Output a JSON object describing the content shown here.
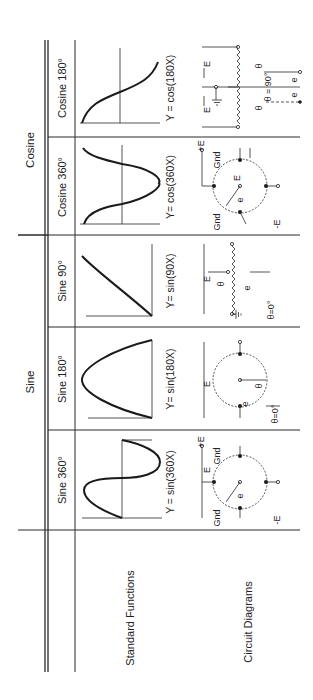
{
  "table": {
    "group_headers": [
      {
        "label": "Sine",
        "spans": [
          "Sine 360°",
          "Sine 180°",
          "Sine 90°"
        ]
      },
      {
        "label": "Cosine",
        "spans": [
          "Cosine 360°",
          "Cosine 180°"
        ]
      }
    ],
    "columns": [
      {
        "label": "Sine 360°",
        "equation": "Y = sin(360X)"
      },
      {
        "label": "Sine 180°",
        "equation": "Y= sin(180X)"
      },
      {
        "label": "Sine 90°",
        "equation": "Y= sin(90X)"
      },
      {
        "label": "Cosine 360°",
        "equation": "Y= cos(360X)"
      },
      {
        "label": "Cosine 180°",
        "equation": "Y = cos(180X)"
      }
    ],
    "row_headers": {
      "standard_functions": "Standard Functions",
      "circuit_diagrams": "Circuit Diagrams"
    }
  },
  "circuit_labels": {
    "gnd": "Gnd",
    "plus_e": "+E",
    "minus_e": "-E",
    "e_upper": "E",
    "e_lower": "e",
    "theta": "θ",
    "theta_zero": "θ=0°",
    "theta_ninety": "θ = 90°"
  }
}
